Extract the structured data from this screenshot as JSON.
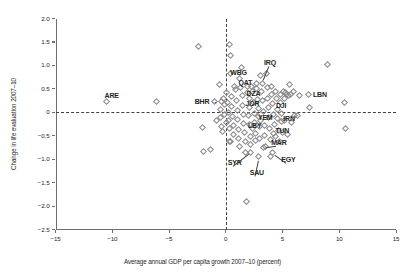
{
  "chart_data": {
    "type": "scatter",
    "title": "",
    "xlabel": "Average annual GDP per capita growth 2007–10 (percent)",
    "ylabel": "Change in life evaluation  2007–10",
    "xlim": [
      -15,
      15
    ],
    "ylim": [
      -2.5,
      2.0
    ],
    "xticks": [
      -15,
      -10,
      -5,
      0,
      5,
      10,
      15
    ],
    "xtick_labels": [
      "−15",
      "−10",
      "−5",
      "0",
      "5",
      "10",
      "15"
    ],
    "yticks": [
      2.0,
      1.5,
      1.0,
      0.5,
      0,
      -0.5,
      -1.0,
      -1.5,
      -2.0,
      -2.5
    ],
    "ytick_labels": [
      "2.0",
      "1.5",
      "1.0",
      "0.5",
      "0",
      "−0.5",
      "−1.0",
      "−1.5",
      "−2.0",
      "−2.5"
    ],
    "grid": false,
    "legend": "none",
    "reference_lines": [
      {
        "axis": "y",
        "value": 0,
        "style": "dashed"
      },
      {
        "axis": "x",
        "value": 0,
        "style": "dashed"
      }
    ],
    "marker": "open-diamond",
    "labeled_points": [
      {
        "code": "ARE",
        "x": -10.5,
        "y": 0.23,
        "label_dx": -2,
        "label_dy": -9,
        "leader": null
      },
      {
        "code": "BHR",
        "x": -0.35,
        "y": 0.23,
        "label_dx": -27,
        "label_dy": -3.5,
        "leader": "arrow-right"
      },
      {
        "code": "WBG",
        "x": 0.75,
        "y": 0.55,
        "label_dx": -4,
        "label_dy": -17,
        "leader": null
      },
      {
        "code": "QAT",
        "x": 1.3,
        "y": 0.52,
        "label_dx": -2,
        "label_dy": -8.5,
        "leader": null
      },
      {
        "code": "IRQ",
        "x": 3.2,
        "y": 0.62,
        "label_dx": 2,
        "label_dy": -24,
        "leader": "line"
      },
      {
        "code": "DZA",
        "x": 2.1,
        "y": 0.3,
        "label_dx": -3,
        "label_dy": -8,
        "leader": null
      },
      {
        "code": "JOR",
        "x": 2.1,
        "y": 0.1,
        "label_dx": -4,
        "label_dy": -8,
        "leader": null
      },
      {
        "code": "DJI",
        "x": 4.6,
        "y": 0.05,
        "label_dx": -2,
        "label_dy": -8,
        "leader": null
      },
      {
        "code": "YEM",
        "x": 3.1,
        "y": -0.17,
        "label_dx": -3,
        "label_dy": -6.5,
        "leader": null
      },
      {
        "code": "IRN",
        "x": 4.9,
        "y": -0.2,
        "label_dx": 2,
        "label_dy": -6.5,
        "leader": null
      },
      {
        "code": "LBY",
        "x": 2.4,
        "y": -0.35,
        "label_dx": -5,
        "label_dy": -6.5,
        "leader": null
      },
      {
        "code": "TUN",
        "x": 4.2,
        "y": -0.46,
        "label_dx": 2,
        "label_dy": -7,
        "leader": null
      },
      {
        "code": "MAR",
        "x": 3.3,
        "y": -0.76,
        "label_dx": 8,
        "label_dy": -9,
        "leader": "line"
      },
      {
        "code": "EGY",
        "x": 4.1,
        "y": -0.86,
        "label_dx": 9,
        "label_dy": 3,
        "leader": "line"
      },
      {
        "code": "SYR",
        "x": 2.2,
        "y": -0.85,
        "label_dx": -23,
        "label_dy": 7,
        "leader": "line"
      },
      {
        "code": "SAU",
        "x": 2.9,
        "y": -0.95,
        "label_dx": -9,
        "label_dy": 12,
        "leader": "line"
      },
      {
        "code": "LBN",
        "x": 7.25,
        "y": 0.38,
        "label_dx": 5,
        "label_dy": -3.5,
        "leader": null
      }
    ],
    "unlabeled_points": [
      {
        "x": -6.1,
        "y": 0.23
      },
      {
        "x": -2.4,
        "y": 1.4
      },
      {
        "x": -2.05,
        "y": -0.32
      },
      {
        "x": -2.0,
        "y": -0.83
      },
      {
        "x": -1.3,
        "y": -0.8
      },
      {
        "x": -0.95,
        "y": 0.22
      },
      {
        "x": -0.55,
        "y": 0.6
      },
      {
        "x": -0.5,
        "y": 0.05
      },
      {
        "x": -0.45,
        "y": -0.12
      },
      {
        "x": -0.4,
        "y": -0.3
      },
      {
        "x": -0.8,
        "y": -0.18
      },
      {
        "x": -0.3,
        "y": -0.42
      },
      {
        "x": -0.2,
        "y": 0.3
      },
      {
        "x": -0.15,
        "y": 0.16
      },
      {
        "x": -0.1,
        "y": -0.05
      },
      {
        "x": 0.05,
        "y": -0.22
      },
      {
        "x": 0.1,
        "y": 0.42
      },
      {
        "x": 0.15,
        "y": 0.2
      },
      {
        "x": 0.2,
        "y": 0.0
      },
      {
        "x": 0.25,
        "y": -0.18
      },
      {
        "x": 0.3,
        "y": -0.35
      },
      {
        "x": 0.35,
        "y": 1.45
      },
      {
        "x": 0.45,
        "y": 1.22
      },
      {
        "x": 0.4,
        "y": 0.82
      },
      {
        "x": 0.5,
        "y": 0.33
      },
      {
        "x": 0.55,
        "y": 0.12
      },
      {
        "x": 0.6,
        "y": -0.08
      },
      {
        "x": 0.65,
        "y": -0.28
      },
      {
        "x": 0.7,
        "y": -0.48
      },
      {
        "x": 0.42,
        "y": -0.63
      },
      {
        "x": 0.3,
        "y": -0.62
      },
      {
        "x": 0.9,
        "y": 0.48
      },
      {
        "x": 0.95,
        "y": 0.26
      },
      {
        "x": 1.0,
        "y": 0.04
      },
      {
        "x": 1.05,
        "y": -0.16
      },
      {
        "x": 1.1,
        "y": -0.36
      },
      {
        "x": 1.15,
        "y": -0.55
      },
      {
        "x": 1.2,
        "y": -0.72
      },
      {
        "x": 1.25,
        "y": 0.72
      },
      {
        "x": 1.4,
        "y": 0.95
      },
      {
        "x": 1.45,
        "y": 0.35
      },
      {
        "x": 1.5,
        "y": 0.15
      },
      {
        "x": 1.55,
        "y": -0.04
      },
      {
        "x": 1.6,
        "y": -0.24
      },
      {
        "x": 1.65,
        "y": -0.44
      },
      {
        "x": 1.7,
        "y": -0.62
      },
      {
        "x": 1.75,
        "y": -0.85
      },
      {
        "x": 1.8,
        "y": -1.9
      },
      {
        "x": 1.9,
        "y": 0.55
      },
      {
        "x": 1.95,
        "y": 0.42
      },
      {
        "x": 2.0,
        "y": -0.06
      },
      {
        "x": 2.05,
        "y": -0.25
      },
      {
        "x": 2.15,
        "y": -0.52
      },
      {
        "x": 2.2,
        "y": -0.68
      },
      {
        "x": 2.3,
        "y": 0.55
      },
      {
        "x": 2.35,
        "y": 0.44
      },
      {
        "x": 2.45,
        "y": 0.2
      },
      {
        "x": 2.5,
        "y": -0.02
      },
      {
        "x": 2.55,
        "y": -0.22
      },
      {
        "x": 2.6,
        "y": -0.45
      },
      {
        "x": 2.65,
        "y": -0.6
      },
      {
        "x": 2.7,
        "y": 0.62
      },
      {
        "x": 2.75,
        "y": 0.5
      },
      {
        "x": 2.8,
        "y": 0.28
      },
      {
        "x": 2.85,
        "y": 0.08
      },
      {
        "x": 2.9,
        "y": -0.1
      },
      {
        "x": 2.95,
        "y": -0.3
      },
      {
        "x": 3.0,
        "y": -0.55
      },
      {
        "x": 3.05,
        "y": 0.78
      },
      {
        "x": 3.15,
        "y": 0.45
      },
      {
        "x": 3.25,
        "y": 0.25
      },
      {
        "x": 3.3,
        "y": 0.02
      },
      {
        "x": 3.4,
        "y": -0.28
      },
      {
        "x": 3.45,
        "y": -0.5
      },
      {
        "x": 3.5,
        "y": -0.72
      },
      {
        "x": 3.6,
        "y": 0.82
      },
      {
        "x": 3.65,
        "y": 0.52
      },
      {
        "x": 3.7,
        "y": 0.3
      },
      {
        "x": 3.75,
        "y": 0.1
      },
      {
        "x": 3.8,
        "y": -0.12
      },
      {
        "x": 3.85,
        "y": -0.34
      },
      {
        "x": 3.9,
        "y": -0.58
      },
      {
        "x": 3.95,
        "y": -0.95
      },
      {
        "x": 4.0,
        "y": 0.55
      },
      {
        "x": 4.05,
        "y": 0.38
      },
      {
        "x": 4.1,
        "y": 0.18
      },
      {
        "x": 4.2,
        "y": -0.05
      },
      {
        "x": 4.3,
        "y": -0.26
      },
      {
        "x": 4.35,
        "y": -0.52
      },
      {
        "x": 4.4,
        "y": 0.45
      },
      {
        "x": 4.5,
        "y": 0.3
      },
      {
        "x": 4.55,
        "y": -0.14
      },
      {
        "x": 4.65,
        "y": -0.38
      },
      {
        "x": 4.7,
        "y": -0.62
      },
      {
        "x": 4.8,
        "y": 0.38
      },
      {
        "x": 4.85,
        "y": 0.2
      },
      {
        "x": 4.95,
        "y": -0.02
      },
      {
        "x": 5.0,
        "y": -0.44
      },
      {
        "x": 5.1,
        "y": 0.44
      },
      {
        "x": 5.15,
        "y": 0.3
      },
      {
        "x": 5.2,
        "y": -0.18
      },
      {
        "x": 5.3,
        "y": 0.42
      },
      {
        "x": 5.35,
        "y": 0.38
      },
      {
        "x": 5.4,
        "y": -0.48
      },
      {
        "x": 5.5,
        "y": 0.35
      },
      {
        "x": 5.6,
        "y": 0.6
      },
      {
        "x": 5.7,
        "y": 0.38
      },
      {
        "x": 5.8,
        "y": -0.22
      },
      {
        "x": 6.0,
        "y": 0.45
      },
      {
        "x": 6.1,
        "y": -0.06
      },
      {
        "x": 6.3,
        "y": -0.07
      },
      {
        "x": 6.5,
        "y": 0.35
      },
      {
        "x": 7.4,
        "y": 0.1
      },
      {
        "x": 8.95,
        "y": 1.02
      },
      {
        "x": 10.5,
        "y": 0.2
      },
      {
        "x": 10.55,
        "y": -0.34
      }
    ]
  }
}
